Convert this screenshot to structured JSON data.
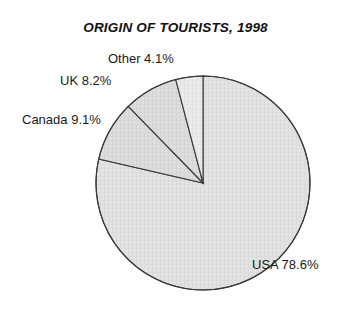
{
  "chart_data": {
    "type": "pie",
    "title": "ORIGIN OF TOURISTS, 1998",
    "xlabel": "",
    "ylabel": "",
    "legend_position": "none",
    "grid": false,
    "start_angle_deg": 90,
    "direction": "clockwise",
    "units": "percent",
    "categories": [
      "USA",
      "Canada",
      "UK",
      "Other"
    ],
    "values": [
      78.6,
      9.1,
      8.2,
      4.1
    ],
    "labels": [
      "USA 78.6%",
      "Canada 9.1%",
      "UK 8.2%",
      "Other 4.1%"
    ],
    "slices": [
      {
        "name": "USA",
        "value": 78.6,
        "label": "USA 78.6%",
        "fill": "#e3e3e3",
        "stroke": "#3a3a3a",
        "start_deg": 0.0,
        "sweep_deg": 282.96
      },
      {
        "name": "Canada",
        "value": 9.1,
        "label": "Canada 9.1%",
        "fill": "#dcdcdc",
        "stroke": "#3a3a3a",
        "start_deg": 282.96,
        "sweep_deg": 32.76
      },
      {
        "name": "UK",
        "value": 8.2,
        "label": "UK 8.2%",
        "fill": "#dcdcdc",
        "stroke": "#3a3a3a",
        "start_deg": 315.72,
        "sweep_deg": 29.52
      },
      {
        "name": "Other",
        "value": 4.1,
        "label": "Other 4.1%",
        "fill": "#eaeaea",
        "stroke": "#3a3a3a",
        "start_deg": 345.24,
        "sweep_deg": 14.76
      }
    ],
    "geometry": {
      "center_x": 203,
      "center_y": 183,
      "radius": 107
    },
    "colors": {
      "background": "#ffffff",
      "title": "#111111",
      "label": "#1a1a1a",
      "outline": "#3a3a3a"
    }
  }
}
